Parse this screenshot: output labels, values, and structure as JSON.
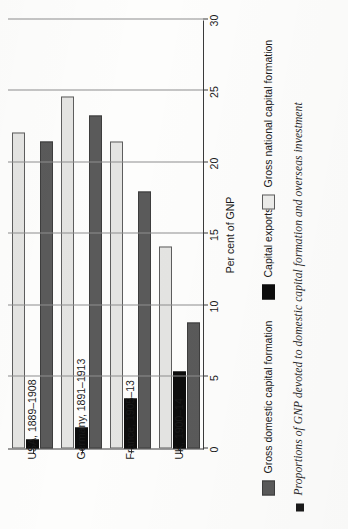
{
  "chart_data": {
    "type": "bar",
    "orientation": "horizontal",
    "title": "",
    "xlabel": "Per cent of GNP",
    "ylabel": "",
    "xlim": [
      0,
      30
    ],
    "grid": true,
    "legend_position": "below",
    "ticks": [
      "0",
      "5",
      "10",
      "15",
      "20",
      "25",
      "30"
    ],
    "tick_values": [
      0,
      5,
      10,
      15,
      20,
      25,
      30
    ],
    "categories": [
      "UK, 1900–14",
      "France, 1905–13",
      "Germany, 1891–1913",
      "USA, 1889–1908"
    ],
    "series": [
      {
        "name": "Gross domestic capital formation",
        "color": "#5a5a5a",
        "values": [
          8.8,
          18.0,
          23.3,
          21.5
        ]
      },
      {
        "name": "Capital exports",
        "color": "#0d0d0d",
        "values": [
          5.4,
          3.5,
          1.5,
          0.6
        ]
      },
      {
        "name": "Gross national capital formation",
        "color": "#e4e4e2",
        "values": [
          14.1,
          21.5,
          24.6,
          22.1
        ]
      }
    ]
  },
  "axis": {
    "label": "Per cent of GNP"
  },
  "legend": {
    "items": [
      {
        "label": "Gross domestic capital formation",
        "swatch": "gdcf"
      },
      {
        "label": "Capital exports",
        "swatch": "ce"
      },
      {
        "label": "Gross national capital formation",
        "swatch": "gncf"
      }
    ]
  },
  "caption": {
    "text": "Proportions of GNP devoted to domestic capital formation and overseas investment"
  }
}
